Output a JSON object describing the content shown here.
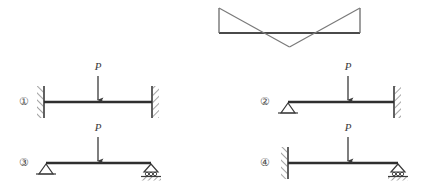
{
  "figure": {
    "background_color": "#ffffff",
    "line_color": "#555555",
    "beam_color": "#3a3a3a",
    "label_color": "#4a4a4a"
  },
  "moment_diagram": {
    "name": "bending-moment-diagram",
    "baseline_y": 33,
    "left_x": 219,
    "right_x": 360,
    "top_y": 8,
    "bottom_y": 47,
    "center_x": 289.5,
    "description_points": {
      "left_peak": [
        219,
        8
      ],
      "right_peak": [
        360,
        8
      ],
      "center_dip": [
        289.5,
        47
      ],
      "left_zero_cross": [
        257,
        33
      ],
      "right_zero_cross": [
        322,
        33
      ]
    }
  },
  "beams": [
    {
      "id": "beam-1",
      "index_label": "①",
      "index_x": 24,
      "index_y": 102,
      "axis_y": 102,
      "start_x": 44,
      "end_x": 152,
      "left_support": "fixed-wall-left",
      "right_support": "fixed-wall-right",
      "load_label": "P",
      "load_x": 98,
      "load_label_y": 70,
      "arrow_top_y": 76,
      "arrow_bottom_y": 100
    },
    {
      "id": "beam-2",
      "index_label": "②",
      "index_x": 265,
      "index_y": 102,
      "axis_y": 102,
      "start_x": 288,
      "end_x": 394,
      "left_support": "pin-triangle",
      "right_support": "fixed-wall-right",
      "load_label": "P",
      "load_x": 348,
      "load_label_y": 70,
      "arrow_top_y": 76,
      "arrow_bottom_y": 100
    },
    {
      "id": "beam-3",
      "index_label": "③",
      "index_x": 24,
      "index_y": 163,
      "axis_y": 163,
      "start_x": 46,
      "end_x": 151,
      "left_support": "pin-triangle",
      "right_support": "roller",
      "load_label": "P",
      "load_x": 98,
      "load_label_y": 131,
      "arrow_top_y": 137,
      "arrow_bottom_y": 161
    },
    {
      "id": "beam-4",
      "index_label": "④",
      "index_x": 265,
      "index_y": 163,
      "axis_y": 163,
      "start_x": 288,
      "end_x": 398,
      "left_support": "fixed-wall-left",
      "right_support": "roller",
      "load_label": "P",
      "load_x": 348,
      "load_label_y": 131,
      "arrow_top_y": 137,
      "arrow_bottom_y": 161
    }
  ]
}
